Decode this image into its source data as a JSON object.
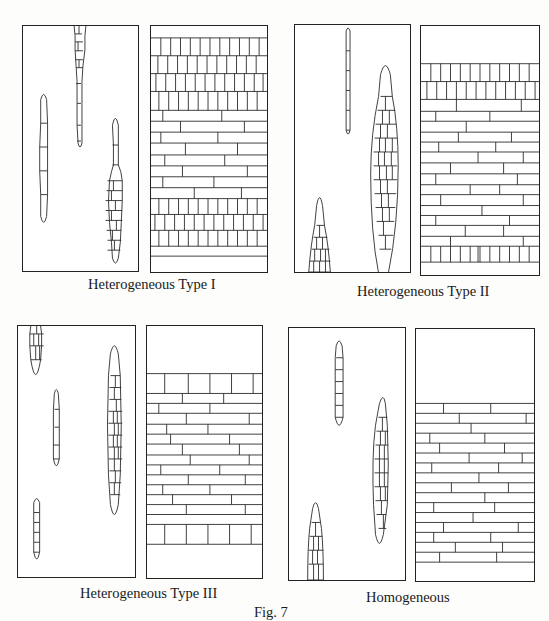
{
  "figure": {
    "label": "Fig. 7"
  },
  "panels": [
    {
      "id": "type-1",
      "caption": "Heterogeneous Type I",
      "left_section": "tangential view: uniseriate and multiseriate rays",
      "right_section": "radial view: upright rows top and bottom, procumbent cells middle"
    },
    {
      "id": "type-2",
      "caption": "Heterogeneous Type II",
      "left_section": "tangential view: uniseriate and multiseriate rays",
      "right_section": "radial view: upright rows at margins, procumbent cells body"
    },
    {
      "id": "type-3",
      "caption": "Heterogeneous Type III",
      "left_section": "tangential view: uniseriate and multiseriate rays",
      "right_section": "radial view: single square row at margins, procumbent body"
    },
    {
      "id": "homogeneous",
      "caption": "Homogeneous",
      "left_section": "tangential view: multiseriate rays",
      "right_section": "radial view: all procumbent cells"
    }
  ]
}
